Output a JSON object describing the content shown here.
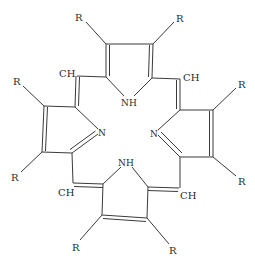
{
  "diagram": {
    "substituent_label": "R",
    "labels": {
      "r_top_left": "R",
      "r_top_right": "R",
      "r_left_upper": "R",
      "r_left_lower": "R",
      "r_right_upper": "R",
      "r_right_lower": "R",
      "r_bottom_left": "R",
      "r_bottom_right": "R",
      "ch_top_left": "CH",
      "ch_top_right": "CH",
      "ch_bottom_left": "CH",
      "ch_bottom_right": "CH",
      "nh_top": "NH",
      "nh_bottom": "NH",
      "n_left": "N",
      "n_right": "N"
    },
    "stroke_color": "#3a3a3a",
    "text_color": "#2a2a2a",
    "background": "#ffffff"
  }
}
